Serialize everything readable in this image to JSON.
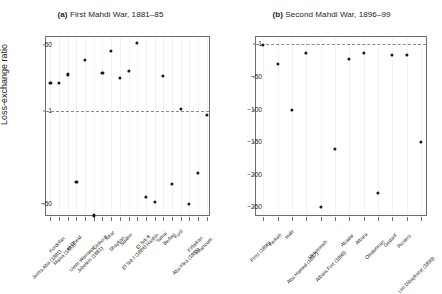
{
  "figure": {
    "ylabel": "Loss-exchange ratio",
    "point_color": "#1a1a1a",
    "refline_color": "#8a8a8a",
    "axis_color": "#6d6e71"
  },
  "panels": [
    {
      "tag": "(a)",
      "title": "First Mahdi War, 1881–85",
      "ylabel": "Loss-exchange ratio",
      "refline": 1,
      "yticks": [
        "50",
        "1",
        "−50"
      ]
    },
    {
      "tag": "(b)",
      "title": "Second Mahdi War, 1896–99",
      "ylabel": "",
      "refline": 1,
      "yticks": [
        "1",
        "−50",
        "−100",
        "−150",
        "−200",
        "−250"
      ]
    }
  ],
  "chart_data": [
    {
      "type": "scatter",
      "title": "(a) First Mahdi War, 1881–85",
      "xlabel": "",
      "ylabel": "Loss-exchange ratio",
      "ylim": [
        -95,
        75
      ],
      "yticks": [
        50,
        1,
        -50
      ],
      "ytick_labels": [
        "50",
        "1",
        "−50"
      ],
      "reference_line": 1,
      "grid": "light vertical gridlines at each category",
      "legend": "none",
      "categories": [
        "Jezira Aba (1881)",
        "Kordofan",
        "Maiva (1882)",
        "el Obeid",
        "Umm Warraqat",
        "Jebelein (1881)",
        "Ginkoi II",
        "Tokar",
        "Shaykan",
        "Suakin",
        "El Teb I (1884)",
        "El Teb II",
        "Hashin",
        "Tamai",
        "Berber",
        "Korti",
        "Abu Klea (1885)",
        "Kirbekan",
        "Khartoum"
      ],
      "values": [
        7,
        7,
        11,
        -16,
        24,
        -88,
        12,
        38,
        9,
        13,
        55,
        -34,
        -44,
        10,
        -18,
        1.2,
        -50,
        -10,
        0.6
      ]
    },
    {
      "type": "scatter",
      "title": "(b) Second Mahdi War, 1896–99",
      "xlabel": "",
      "ylabel": "",
      "ylim": [
        -265,
        12
      ],
      "yticks": [
        1,
        -50,
        -100,
        -150,
        -200,
        -250
      ],
      "ytick_labels": [
        "1",
        "−50",
        "−100",
        "−150",
        "−200",
        "−250"
      ],
      "reference_line": 1,
      "grid": "light vertical gridlines at each category",
      "legend": "none",
      "categories": [
        "Firrci (1896)",
        "Ferkeh",
        "Hafir",
        "Abu Hamed (1897)",
        "Metemmeh",
        "Atbara Fort (1898)",
        "Abadar",
        "Atbara",
        "Omdurman",
        "Gedarif",
        "Rosiers",
        "Um Dibaykarat (1899)"
      ],
      "values": [
        0,
        -30,
        -100,
        -12,
        -250,
        -160,
        -22,
        -12,
        -228,
        -15,
        -15,
        -150
      ]
    }
  ]
}
